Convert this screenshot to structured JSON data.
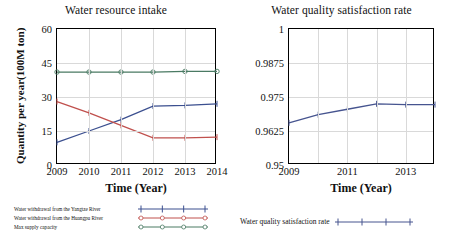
{
  "figure": {
    "background": "#ffffff"
  },
  "panels": [
    {
      "id": "water-resource-intake",
      "title": "Water resource intake",
      "xlabel": "Time (Year)",
      "ylabel": "Quantity per year(100M ton)"
    },
    {
      "id": "water-quality-satisfaction-rate",
      "title": "Water quality satisfaction rate",
      "xlabel": "Time (Year)",
      "ylabel": ""
    }
  ],
  "colors": {
    "yangtze": "#3b4f8f",
    "huangpu": "#c0504d",
    "max_supply": "#4a7a63",
    "satisfaction": "#46548f",
    "grid": "#d9d9d9",
    "axis": "#000000"
  },
  "chart_data": [
    {
      "type": "line",
      "title": "Water resource intake",
      "xlabel": "Time (Year)",
      "ylabel": "Quantity per year(100M ton)",
      "categories": [
        2009,
        2010,
        2011,
        2012,
        2013,
        2014
      ],
      "xticklabels": [
        "2009",
        "2010",
        "2011",
        "2012",
        "2013",
        "2014"
      ],
      "yticklabels": [
        "0",
        "15",
        "30",
        "45",
        "60"
      ],
      "xlim": [
        2009,
        2014
      ],
      "ylim": [
        0,
        60
      ],
      "yticks": [
        0,
        15,
        30,
        45,
        60
      ],
      "grid": true,
      "legend_position": "below",
      "series": [
        {
          "name": "Water withdrawal from the Yangtze River",
          "color": "#3b4f8f",
          "marker": "plus",
          "values": [
            10.0,
            15.0,
            20.0,
            26.0,
            26.3,
            27.0
          ]
        },
        {
          "name": "Water withdrawal from the Huangpu River",
          "color": "#c0504d",
          "marker": "plus",
          "values": [
            28.0,
            23.0,
            17.5,
            12.0,
            12.0,
            12.3
          ]
        },
        {
          "name": "Max supply capacity",
          "color": "#4a7a63",
          "marker": "circle",
          "values": [
            41.0,
            41.0,
            41.0,
            41.0,
            41.3,
            41.3
          ]
        }
      ]
    },
    {
      "type": "line",
      "title": "Water quality satisfaction rate",
      "xlabel": "Time (Year)",
      "ylabel": "",
      "categories": [
        2009,
        2010,
        2011,
        2012,
        2013,
        2014
      ],
      "xticklabels": [
        "2009",
        "2011",
        "2013"
      ],
      "xticks": [
        2009,
        2011,
        2013
      ],
      "yticklabels": [
        "0.95",
        "0.9625",
        "0.975",
        "0.9875",
        "1"
      ],
      "yticks": [
        0.95,
        0.9625,
        0.975,
        0.9875,
        1
      ],
      "xlim": [
        2009,
        2014
      ],
      "ylim": [
        0.95,
        1
      ],
      "grid": true,
      "legend_position": "below",
      "series": [
        {
          "name": "Water quality satisfaction rate",
          "color": "#46548f",
          "marker": "plus",
          "values": [
            0.9655,
            0.9685,
            0.9705,
            0.9725,
            0.9722,
            0.9722
          ]
        }
      ]
    }
  ],
  "legends": {
    "left": [
      {
        "label": "Water withdrawal from the Yangtze River",
        "color": "#3b4f8f",
        "marker": "plus"
      },
      {
        "label": "Water withdrawal from the Huangpu River",
        "color": "#c0504d",
        "marker": "circle"
      },
      {
        "label": "Max supply capacity",
        "color": "#4a7a63",
        "marker": "circle"
      }
    ],
    "right": [
      {
        "label": "Water quality satisfaction rate",
        "color": "#46548f",
        "marker": "plus"
      }
    ]
  }
}
